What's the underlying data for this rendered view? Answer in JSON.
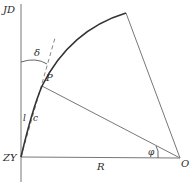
{
  "diagram": {
    "type": "circular-curve-geometry",
    "labels": {
      "jd": "JD",
      "zy": "ZY",
      "p": "P",
      "o": "O",
      "r": "R",
      "delta": "δ",
      "phi": "φ",
      "l": "l",
      "c": "c"
    },
    "points": {
      "ZY": [
        21,
        157
      ],
      "P": [
        42,
        86
      ],
      "O": [
        180,
        158
      ],
      "arc_end": [
        126,
        13
      ],
      "tangent_top": [
        55,
        38
      ],
      "vertical_top": [
        21,
        4
      ],
      "vertical_bottom": [
        21,
        182
      ]
    },
    "colors": {
      "line": "#777777",
      "curve": "#333333",
      "text": "#2a2a2a"
    }
  }
}
